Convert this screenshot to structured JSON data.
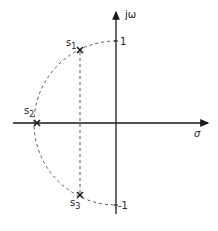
{
  "diagram": {
    "type": "s-plane pole diagram",
    "axes": {
      "imag_label": "jω",
      "real_label": "σ",
      "tick_pos_label": "1",
      "tick_neg_label": "-1"
    },
    "poles": [
      {
        "label": "s",
        "sub": "1",
        "x": 80,
        "y": 50
      },
      {
        "label": "s",
        "sub": "2",
        "x": 37,
        "y": 123
      },
      {
        "label": "s",
        "sub": "3",
        "x": 80,
        "y": 195
      }
    ],
    "colors": {
      "line": "#1a1a1a",
      "dashed": "#555555"
    }
  }
}
